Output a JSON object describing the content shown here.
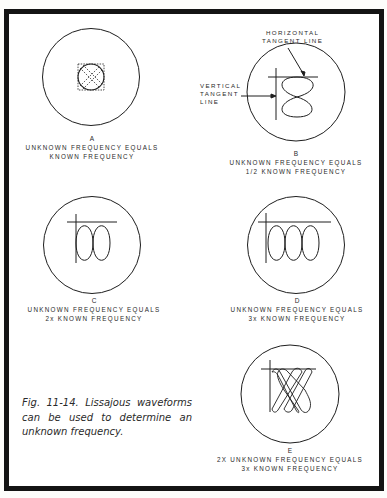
{
  "figure": {
    "number": "Fig. 11-14.",
    "caption": "Fig. 11-14. Lissajous waveforms can be used to determine an unknown frequency."
  },
  "panels": [
    {
      "id": "A",
      "letter": "A",
      "line1": "UNKNOWN FREQUENCY EQUALS",
      "line2": "KNOWN FREQUENCY",
      "ratio": "1:1"
    },
    {
      "id": "B",
      "letter": "B",
      "line1": "UNKNOWN FREQUENCY EQUALS",
      "line2": "1/2 KNOWN FREQUENCY",
      "ratio": "1:2"
    },
    {
      "id": "C",
      "letter": "C",
      "line1": "UNKNOWN FREQUENCY EQUALS",
      "line2": "2x KNOWN FREQUENCY",
      "ratio": "2:1"
    },
    {
      "id": "D",
      "letter": "D",
      "line1": "UNKNOWN FREQUENCY EQUALS",
      "line2": "3x KNOWN FREQUENCY",
      "ratio": "3:1"
    },
    {
      "id": "E",
      "letter": "E",
      "line1": "2X UNKNOWN FREQUENCY EQUALS",
      "line2": "3x KNOWN FREQUENCY",
      "ratio": "3:2"
    }
  ],
  "annotations": {
    "horizontal_tangent": {
      "line1": "HORIZONTAL",
      "line2": "TANGENT LINE"
    },
    "vertical_tangent": {
      "line1": "VERTICAL",
      "line2": "TANGENT",
      "line3": "LINE"
    }
  },
  "colors": {
    "ink": "#1e1e1e",
    "border": "#141414",
    "paper": "#ffffff"
  }
}
